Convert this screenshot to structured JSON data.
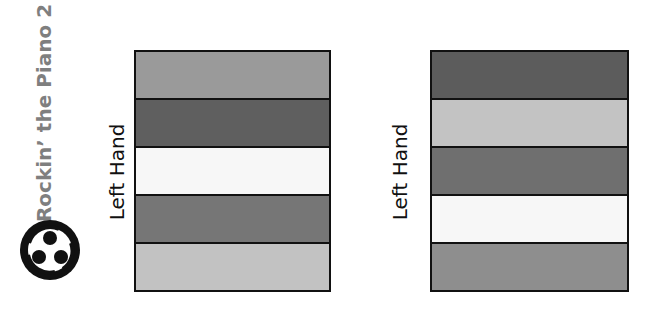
{
  "title": "Rockin’ the Piano 2",
  "logo": {
    "icon": "three-people-circle-logo"
  },
  "diagrams": [
    {
      "label": "Left Hand",
      "bands": [
        {
          "color": "#9a9a9a"
        },
        {
          "color": "#5f5f5f"
        },
        {
          "color": "#f7f7f7"
        },
        {
          "color": "#767676"
        },
        {
          "color": "#c2c2c2"
        }
      ]
    },
    {
      "label": "Left Hand",
      "bands": [
        {
          "color": "#5c5c5c"
        },
        {
          "color": "#c3c3c3"
        },
        {
          "color": "#6f6f6f"
        },
        {
          "color": "#f7f7f7"
        },
        {
          "color": "#8e8e8e"
        }
      ]
    }
  ]
}
